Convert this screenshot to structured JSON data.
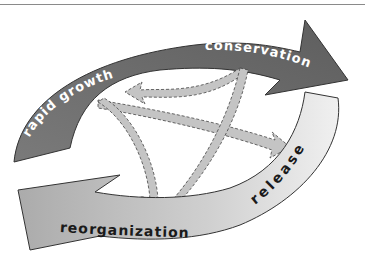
{
  "diagram": {
    "phases": [
      {
        "id": "rapid_growth",
        "label": "rapid growth",
        "color": "#707070",
        "text_color": "#ffffff"
      },
      {
        "id": "conservation",
        "label": "conservation",
        "color": "#666666",
        "text_color": "#ffffff"
      },
      {
        "id": "release",
        "label": "release",
        "color": "#e4e4e4",
        "text_color": "#1a1a1a"
      },
      {
        "id": "reorganization",
        "label": "reorganization",
        "color": "#b8b8b8",
        "text_color": "#1a1a1a"
      }
    ],
    "transitions": [
      {
        "from": "conservation",
        "to": "rapid_growth",
        "style": "dashed"
      },
      {
        "from": "conservation",
        "to": "reorganization",
        "style": "dashed"
      },
      {
        "from": "rapid_growth",
        "to": "release",
        "style": "dashed"
      },
      {
        "from": "rapid_growth",
        "to": "reorganization",
        "style": "dashed"
      }
    ],
    "colors": {
      "inner_arrow": "#c4c4c4",
      "outline": "#3a3a3a",
      "rule": "#8a8a8a"
    }
  }
}
